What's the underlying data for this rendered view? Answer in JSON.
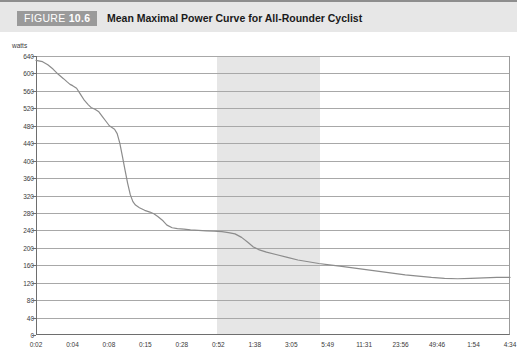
{
  "header": {
    "figure_prefix": "FIGURE",
    "figure_number": "10.6",
    "title": "Mean Maximal Power Curve for All-Rounder Cyclist"
  },
  "chart_data": {
    "type": "line",
    "title": "Mean Maximal Power Curve for All-Rounder Cyclist",
    "xlabel": "",
    "ylabel": "watts",
    "unit_label": "watts",
    "ylim": [
      0,
      640
    ],
    "ytick_step": 40,
    "yticks": [
      0,
      40,
      80,
      120,
      160,
      200,
      240,
      280,
      320,
      360,
      400,
      440,
      480,
      520,
      560,
      600,
      640
    ],
    "ytick_labels": [
      "0",
      "40",
      "80",
      "120",
      "160",
      "200",
      "240",
      "280",
      "320",
      "360",
      "400",
      "440",
      "480",
      "520",
      "560",
      "600",
      "640"
    ],
    "grid": true,
    "legend": null,
    "xtick_labels": [
      "0:02",
      "0:04",
      "0:08",
      "0:15",
      "0:28",
      "0:52",
      "1:38",
      "3:05",
      "5:49",
      "11:31",
      "23:56",
      "49:46",
      "1:54",
      "4:34"
    ],
    "x": [
      "0:02",
      "0:04",
      "0:08",
      "0:15",
      "0:28",
      "0:52",
      "1:38",
      "3:05",
      "5:49",
      "11:31",
      "23:56",
      "49:46",
      "1:54",
      "4:34"
    ],
    "values": [
      630,
      622,
      600,
      560,
      518,
      480,
      300,
      270,
      248,
      228,
      180,
      150,
      136,
      130
    ],
    "series": [
      {
        "name": "Mean maximal power",
        "color": "#8c8c8c",
        "points": [
          [
            0.0,
            630
          ],
          [
            0.02,
            629
          ],
          [
            0.05,
            627
          ],
          [
            0.09,
            620
          ],
          [
            0.13,
            610
          ],
          [
            0.17,
            598
          ],
          [
            0.21,
            588
          ],
          [
            0.24,
            580
          ],
          [
            0.26,
            575
          ],
          [
            0.28,
            572
          ],
          [
            0.31,
            566
          ],
          [
            0.34,
            552
          ],
          [
            0.37,
            538
          ],
          [
            0.4,
            528
          ],
          [
            0.42,
            522
          ],
          [
            0.45,
            518
          ],
          [
            0.48,
            512
          ],
          [
            0.51,
            500
          ],
          [
            0.54,
            488
          ],
          [
            0.56,
            480
          ],
          [
            0.58,
            476
          ],
          [
            0.6,
            472
          ],
          [
            0.62,
            462
          ],
          [
            0.64,
            440
          ],
          [
            0.66,
            410
          ],
          [
            0.68,
            378
          ],
          [
            0.7,
            348
          ],
          [
            0.72,
            322
          ],
          [
            0.74,
            306
          ],
          [
            0.76,
            298
          ],
          [
            0.79,
            292
          ],
          [
            0.83,
            286
          ],
          [
            0.87,
            282
          ],
          [
            0.9,
            278
          ],
          [
            0.93,
            272
          ],
          [
            0.97,
            262
          ],
          [
            1.0,
            252
          ],
          [
            1.04,
            246
          ],
          [
            1.08,
            244
          ],
          [
            1.13,
            243
          ],
          [
            1.18,
            241
          ],
          [
            1.24,
            240
          ],
          [
            1.3,
            239
          ],
          [
            1.36,
            238
          ],
          [
            1.42,
            237
          ],
          [
            1.47,
            235
          ],
          [
            1.52,
            232
          ],
          [
            1.57,
            224
          ],
          [
            1.62,
            212
          ],
          [
            1.66,
            202
          ],
          [
            1.7,
            196
          ],
          [
            1.76,
            190
          ],
          [
            1.84,
            184
          ],
          [
            1.92,
            178
          ],
          [
            2.0,
            172
          ],
          [
            2.08,
            168
          ],
          [
            2.16,
            164
          ],
          [
            2.24,
            161
          ],
          [
            2.32,
            158
          ],
          [
            2.42,
            154
          ],
          [
            2.52,
            150
          ],
          [
            2.62,
            146
          ],
          [
            2.72,
            142
          ],
          [
            2.82,
            138
          ],
          [
            2.92,
            135
          ],
          [
            3.02,
            132
          ],
          [
            3.12,
            130
          ],
          [
            3.22,
            129
          ],
          [
            3.32,
            130
          ],
          [
            3.42,
            131
          ],
          [
            3.52,
            132
          ],
          [
            3.62,
            132
          ]
        ]
      }
    ],
    "highlight_band": {
      "label": "shaded interval",
      "color": "#e6e6e6",
      "x_start_px": 217,
      "x_end_px": 320
    }
  },
  "colors": {
    "header_bg": "#e7e7e7",
    "badge_bg": "#9a9a9a",
    "curve": "#8c8c8c",
    "grid": "#a8a8a8",
    "axis": "#6e6e6e",
    "band": "#e6e6e6"
  }
}
